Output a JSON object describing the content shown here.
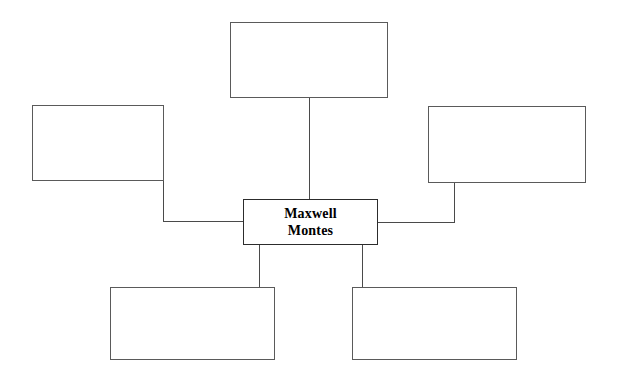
{
  "diagram": {
    "type": "concept-map",
    "canvas": {
      "width": 619,
      "height": 379,
      "background": "#ffffff"
    },
    "style": {
      "border_color": "#5a5a5a",
      "center_border_color": "#2c2c2c",
      "connector_color": "#4a4a4a",
      "text_color": "#000000"
    },
    "center_node": {
      "id": "center",
      "label": "Maxwell\nMontes",
      "x": 243,
      "y": 199,
      "width": 135,
      "height": 46
    },
    "nodes": [
      {
        "id": "top",
        "label": "",
        "x": 230,
        "y": 22,
        "width": 158,
        "height": 76
      },
      {
        "id": "left",
        "label": "",
        "x": 32,
        "y": 105,
        "width": 132,
        "height": 76
      },
      {
        "id": "right",
        "label": "",
        "x": 428,
        "y": 106,
        "width": 158,
        "height": 77
      },
      {
        "id": "bottom-left",
        "label": "",
        "x": 110,
        "y": 287,
        "width": 165,
        "height": 73
      },
      {
        "id": "bottom-right",
        "label": "",
        "x": 352,
        "y": 287,
        "width": 165,
        "height": 73
      }
    ],
    "connectors": [
      {
        "id": "center-to-top",
        "from": "center",
        "to": "top",
        "kind": "straight-vertical"
      },
      {
        "id": "center-to-left",
        "from": "center",
        "to": "left",
        "kind": "elbow"
      },
      {
        "id": "center-to-right",
        "from": "center",
        "to": "right",
        "kind": "elbow"
      },
      {
        "id": "center-to-bottom-left",
        "from": "center",
        "to": "bottom-left",
        "kind": "straight-vertical"
      },
      {
        "id": "center-to-bottom-right",
        "from": "center",
        "to": "bottom-right",
        "kind": "straight-vertical"
      }
    ]
  }
}
